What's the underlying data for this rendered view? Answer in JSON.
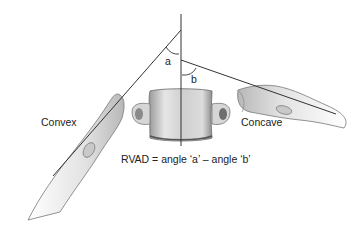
{
  "diagram": {
    "labels": {
      "angle_a": "a",
      "angle_b": "b",
      "convex": "Convex",
      "concave": "Concave",
      "formula": "RVAD = angle ‘a’ – angle ‘b’"
    },
    "colors": {
      "line": "#333333",
      "bone_fill": "#e4e4e4",
      "bone_shade": "#a8a8a8",
      "text": "#222222"
    }
  }
}
